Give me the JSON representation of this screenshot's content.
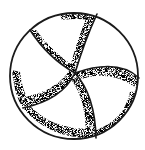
{
  "figure": {
    "subject": "stippled line drawing of a spherical body divided into five curved chambers",
    "line_color": "#1a1a1a",
    "background": "#ffffff",
    "stipple_color": "#3a3a3a",
    "outline": {
      "cx": 74,
      "cy": 76,
      "rx": 64,
      "ry": 63
    },
    "center_vertex": {
      "x": 75,
      "y": 73
    },
    "sutures": [
      {
        "from": [
          75,
          73
        ],
        "ctrl": [
          85,
          40
        ],
        "to": [
          97,
          14
        ]
      },
      {
        "from": [
          75,
          73
        ],
        "ctrl": [
          48,
          58
        ],
        "to": [
          30,
          30
        ]
      },
      {
        "from": [
          75,
          73
        ],
        "ctrl": [
          62,
          100
        ],
        "to": [
          23,
          108
        ]
      },
      {
        "from": [
          75,
          73
        ],
        "ctrl": [
          95,
          95
        ],
        "to": [
          96,
          138
        ]
      },
      {
        "from": [
          75,
          73
        ],
        "ctrl": [
          118,
          58
        ],
        "to": [
          139,
          78
        ]
      }
    ]
  }
}
